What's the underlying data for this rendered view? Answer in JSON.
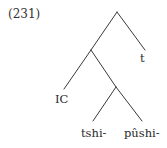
{
  "example": {
    "number": "(231)"
  },
  "tree": {
    "type": "syntax-tree",
    "line_color": "#3a3a3a",
    "nodes": [
      {
        "id": "root",
        "x": 117,
        "y": 12
      },
      {
        "id": "n1",
        "x": 91,
        "y": 50
      },
      {
        "id": "n2",
        "x": 116,
        "y": 87
      }
    ],
    "leaves": {
      "t": "t",
      "ic": "IC",
      "tshi": "tshi-",
      "pushi": "pûshi-"
    },
    "edges": [
      {
        "from": "root",
        "to": "n1"
      },
      {
        "from": "root",
        "to": "t"
      },
      {
        "from": "n1",
        "to": "IC"
      },
      {
        "from": "n1",
        "to": "n2"
      },
      {
        "from": "n2",
        "to": "tshi-"
      },
      {
        "from": "n2",
        "to": "pûshi-"
      }
    ]
  }
}
